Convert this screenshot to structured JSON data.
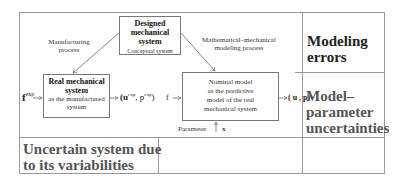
{
  "diagram": {
    "designed_box": {
      "title_line1": "Designed",
      "title_line2": "mechanical",
      "title_line3": "system",
      "subtitle": "Conceptual  system"
    },
    "real_box": {
      "title_line1": "Real mechanical",
      "title_line2": "system",
      "subtitle_line1": "as the manufactured",
      "subtitle_line2": "system"
    },
    "nominal_box": {
      "line1": "Nominal model",
      "line2": "as the predictive",
      "line3": "model of the real",
      "line4": "mechanical system"
    },
    "labels": {
      "manufacturing_line1": "Manufacturing",
      "manufacturing_line2": "process",
      "math_line1": "Mathematical–mechanical",
      "math_line2": "modeling process",
      "f_exp_base": "f",
      "f_exp_sup": "exp",
      "output_exp": "(u",
      "output_exp_sup1": "exp",
      "output_exp_mid": ", p",
      "output_exp_sup2": "exp",
      "output_exp_end": ")",
      "f_input": "f",
      "output_model": "( u , p)",
      "parameter": "Parameter",
      "x": "x"
    },
    "categories": {
      "modeling_errors_line1": "Modeling",
      "modeling_errors_line2": "errors",
      "model_param_line1": "Model–",
      "model_param_line2": "parameter",
      "model_param_line3": "uncertainties",
      "uncertain_line1": "Uncertain system due",
      "uncertain_line2": "to its variabilities"
    }
  }
}
